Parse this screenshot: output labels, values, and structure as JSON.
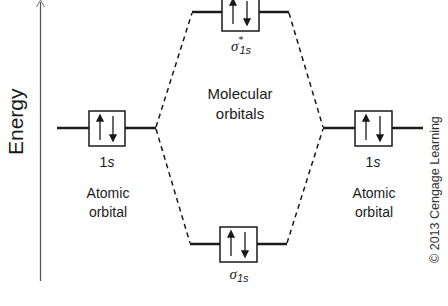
{
  "axis": {
    "label": "Energy"
  },
  "center": {
    "line1": "Molecular",
    "line2": "orbitals"
  },
  "left_atom": {
    "orbital": "1",
    "orbital_italic": "s",
    "electrons": "↑↓",
    "desc_line1": "Atomic",
    "desc_line2": "orbital"
  },
  "right_atom": {
    "orbital": "1",
    "orbital_italic": "s",
    "electrons": "↑↓",
    "desc_line1": "Atomic",
    "desc_line2": "orbital"
  },
  "antibonding": {
    "symbol": "σ",
    "star": "*",
    "subscript": "1s",
    "electrons": "↑↓"
  },
  "bonding": {
    "symbol": "σ",
    "subscript": "1s",
    "electrons": "↑↓"
  },
  "copyright": "© 2013 Cengage Learning",
  "colors": {
    "line": "#1a1a1a",
    "axis": "#555555",
    "background": "#ffffff"
  }
}
